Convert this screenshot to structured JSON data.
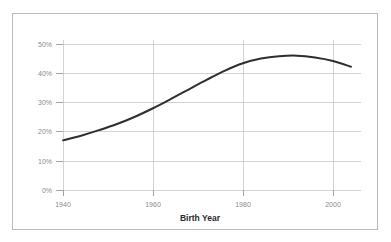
{
  "figure": {
    "background_color": "#ffffff",
    "border_color": "#b9b9b9",
    "plot_background_color": "#ffffff"
  },
  "chart_data": {
    "type": "line",
    "title": "",
    "subtitle": "",
    "xlabel": "Birth Year",
    "ylabel": "",
    "xlim": [
      1936,
      2006
    ],
    "ylim": [
      0,
      50
    ],
    "grid": true,
    "grid_color": "#c8c8c8",
    "legend": false,
    "legend_position": "none",
    "line_color": "#2e2e2e",
    "line_width": 2,
    "y_tick_labels": [
      "0%",
      "10%",
      "20%",
      "30%",
      "40%",
      "50%"
    ],
    "y_tick_values": [
      0,
      10,
      20,
      30,
      40,
      50
    ],
    "x_tick_labels": [
      "1940",
      "1960",
      "1980",
      "2000"
    ],
    "x_tick_values": [
      1940,
      1960,
      1980,
      2000
    ],
    "series": [
      {
        "name": "percentage",
        "x": [
          1940,
          1944,
          1948,
          1952,
          1956,
          1960,
          1964,
          1968,
          1972,
          1976,
          1980,
          1984,
          1988,
          1992,
          1996,
          2000,
          2004
        ],
        "values": [
          17.0,
          18.6,
          20.5,
          22.6,
          25.1,
          28.0,
          31.2,
          34.5,
          37.8,
          40.9,
          43.4,
          45.0,
          45.8,
          46.0,
          45.4,
          44.2,
          42.2
        ]
      }
    ]
  },
  "axis_labels": {
    "y": [
      "50%",
      "40%",
      "30%",
      "20%",
      "10%",
      "0%"
    ],
    "x": [
      "1940",
      "1960",
      "1980",
      "2000"
    ],
    "x_title": "Birth Year"
  }
}
